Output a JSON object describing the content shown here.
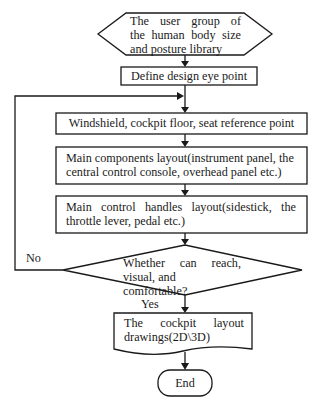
{
  "flowchart": {
    "start": {
      "shape": "hexagon",
      "lines": [
        "The user group of",
        "the human body size",
        "and posture library"
      ]
    },
    "step1": {
      "shape": "rectangle",
      "label": "Define design eye point"
    },
    "step2": {
      "shape": "rectangle",
      "label": "Windshield, cockpit floor, seat reference point"
    },
    "step3": {
      "shape": "rectangle",
      "lines": [
        "Main components layout(instrument panel, the",
        "central control console, overhead panel etc.)"
      ]
    },
    "step4": {
      "shape": "rectangle",
      "lines": [
        "Main control handles layout(sidestick, the",
        "throttle lever, pedal etc.)"
      ]
    },
    "decision": {
      "shape": "diamond",
      "lines": [
        "Whether can reach,",
        "visual, and comfortable?"
      ],
      "no_label": "No",
      "yes_label": "Yes"
    },
    "output": {
      "shape": "document",
      "lines": [
        "The cockpit layout",
        "drawings(2D\\3D)"
      ]
    },
    "end": {
      "shape": "terminator",
      "label": "End"
    }
  },
  "colors": {
    "stroke": "#1a1a1a",
    "background": "#ffffff"
  }
}
